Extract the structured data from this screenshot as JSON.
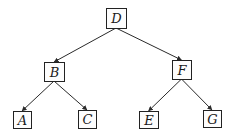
{
  "diagram": {
    "type": "binary-tree",
    "nodes": [
      {
        "id": "D",
        "label": "D",
        "x": 106,
        "y": 8,
        "w": 20,
        "h": 20
      },
      {
        "id": "B",
        "label": "B",
        "x": 44,
        "y": 62,
        "w": 20,
        "h": 19
      },
      {
        "id": "F",
        "label": "F",
        "x": 172,
        "y": 60,
        "w": 19,
        "h": 19
      },
      {
        "id": "A",
        "label": "A",
        "x": 13,
        "y": 111,
        "w": 18,
        "h": 17
      },
      {
        "id": "C",
        "label": "C",
        "x": 78,
        "y": 110,
        "w": 18,
        "h": 18
      },
      {
        "id": "E",
        "label": "E",
        "x": 139,
        "y": 111,
        "w": 19,
        "h": 17
      },
      {
        "id": "G",
        "label": "G",
        "x": 203,
        "y": 110,
        "w": 18,
        "h": 17
      }
    ],
    "edges": [
      {
        "from": "D",
        "to": "B"
      },
      {
        "from": "D",
        "to": "F"
      },
      {
        "from": "B",
        "to": "A"
      },
      {
        "from": "B",
        "to": "C"
      },
      {
        "from": "F",
        "to": "E"
      },
      {
        "from": "F",
        "to": "G"
      }
    ]
  }
}
